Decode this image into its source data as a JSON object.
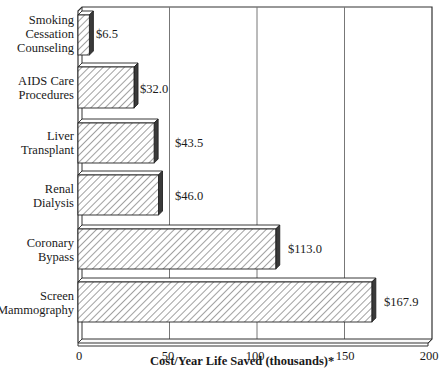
{
  "chart_data": {
    "type": "bar",
    "orientation": "horizontal",
    "title": "",
    "xlabel": "Cost/Year Life Saved (thousands)*",
    "ylabel": "",
    "xlim": [
      0,
      200
    ],
    "xticks": [
      0,
      50,
      100,
      150,
      200
    ],
    "grid": true,
    "categories": [
      "Smoking Cessation Counseling",
      "AIDS Care Procedures",
      "Liver Transplant",
      "Renal Dialysis",
      "Coronary Bypass",
      "Screen Mammography"
    ],
    "values": [
      6.5,
      32.0,
      43.5,
      46.0,
      113.0,
      167.9
    ],
    "value_labels": [
      "$6.5",
      "$32.0",
      "$43.5",
      "$46.0",
      "$113.0",
      "$167.9"
    ],
    "style": "3d-hatched"
  },
  "labels": {
    "categories": [
      "Smoking\nCessation\nCounseling",
      "AIDS Care\nProcedures",
      "Liver\nTransplant",
      "Renal\nDialysis",
      "Coronary\nBypass",
      "Screen\nMammography"
    ],
    "values": [
      "$6.5",
      "$32.0",
      "$43.5",
      "$46.0",
      "$113.0",
      "$167.9"
    ],
    "ticks": [
      "0",
      "50",
      "100",
      "150",
      "200"
    ],
    "x_title": "Cost/Year Life Saved (thousands)*"
  },
  "colors": {
    "bar_face": "#ffffff",
    "hatch": "#333333",
    "bar_side": "#3a3a3a",
    "grid": "#777777",
    "frame": "#333333"
  }
}
